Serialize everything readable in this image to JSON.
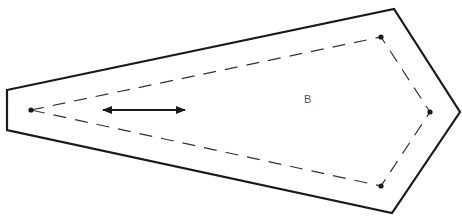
{
  "diagram": {
    "label": "B",
    "colors": {
      "outline": "#1a1a1a",
      "dashed": "#333333",
      "label": "#555555",
      "background": "#ffffff"
    },
    "outer_shape": {
      "points": [
        [
          7,
          90
        ],
        [
          394,
          9
        ],
        [
          460,
          112
        ],
        [
          392,
          213
        ],
        [
          7,
          130
        ]
      ]
    },
    "inner_dashed_shape": {
      "points": [
        [
          31,
          110
        ],
        [
          381,
          37
        ],
        [
          430,
          112
        ],
        [
          381,
          186
        ]
      ],
      "vertex_markers": [
        [
          31,
          110
        ],
        [
          381,
          37
        ],
        [
          430,
          112
        ],
        [
          381,
          186
        ]
      ]
    },
    "double_arrow": {
      "x1": 103,
      "y1": 110,
      "x2": 185,
      "y2": 110
    }
  }
}
